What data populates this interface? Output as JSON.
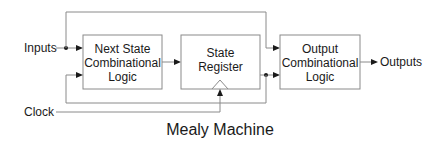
{
  "diagram": {
    "title": "Mealy Machine",
    "signals": {
      "inputs": "Inputs",
      "clock": "Clock",
      "outputs": "Outputs"
    },
    "blocks": [
      {
        "id": "next-state-logic",
        "lines": [
          "Next State",
          "Combinational",
          "Logic"
        ]
      },
      {
        "id": "state-register",
        "lines": [
          "State",
          "Register"
        ]
      },
      {
        "id": "output-logic",
        "lines": [
          "Output",
          "Combinational",
          "Logic"
        ]
      }
    ],
    "connections": [
      {
        "from": "Inputs",
        "to": "next-state-logic"
      },
      {
        "from": "Inputs",
        "to": "output-logic"
      },
      {
        "from": "next-state-logic",
        "to": "state-register"
      },
      {
        "from": "state-register",
        "to": "output-logic"
      },
      {
        "from": "state-register",
        "to": "next-state-logic",
        "kind": "feedback"
      },
      {
        "from": "Clock",
        "to": "state-register",
        "kind": "clock"
      },
      {
        "from": "output-logic",
        "to": "Outputs"
      }
    ]
  }
}
